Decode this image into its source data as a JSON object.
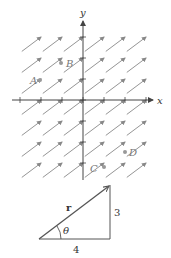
{
  "vector_field": {
    "axes": {
      "x_label": "x",
      "y_label": "y"
    },
    "vector": {
      "dx": 4,
      "dy": 3,
      "description": "constant field, every arrow points in direction (4,3)"
    },
    "grid_columns": 7,
    "grid_rows": 7,
    "points": [
      {
        "label": "A"
      },
      {
        "label": "B"
      },
      {
        "label": "C"
      },
      {
        "label": "D"
      }
    ],
    "colors": {
      "arrow": "#888888",
      "axis": "#444444",
      "point": "#999999"
    }
  },
  "triangle": {
    "hypotenuse_label": "r",
    "angle_label": "θ",
    "vertical_side_label": "3",
    "horizontal_side_label": "4"
  }
}
